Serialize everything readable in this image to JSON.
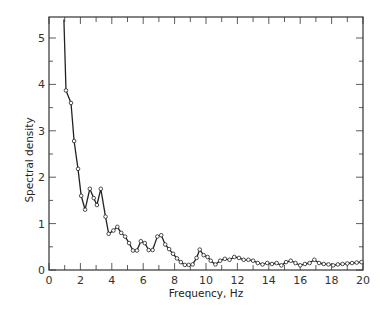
{
  "chart_data": {
    "type": "line",
    "title": "",
    "xlabel": "Frequency, Hz",
    "ylabel": "Spectral density",
    "xlim": [
      0,
      20
    ],
    "ylim": [
      0,
      5.4
    ],
    "xticks": [
      0,
      2,
      4,
      6,
      8,
      10,
      12,
      14,
      16,
      18,
      20
    ],
    "xtick_labels": [
      "0",
      "2",
      "4",
      "6",
      "8",
      "10",
      "12",
      "14",
      "16",
      "18",
      "20"
    ],
    "yticks": [
      0,
      1,
      2,
      3,
      4,
      5
    ],
    "ytick_labels": [
      "0",
      "1",
      "2",
      "3",
      "4",
      "5"
    ],
    "grid": false,
    "legend": null,
    "marker": "open-circle",
    "series": [
      {
        "name": "Spectral density",
        "x": [
          0.95,
          1.08,
          1.4,
          1.6,
          1.85,
          2.05,
          2.3,
          2.6,
          2.85,
          3.05,
          3.3,
          3.6,
          3.8,
          4.1,
          4.35,
          4.6,
          4.85,
          5.1,
          5.35,
          5.6,
          5.85,
          6.1,
          6.35,
          6.6,
          6.9,
          7.15,
          7.4,
          7.65,
          7.9,
          8.15,
          8.4,
          8.65,
          8.9,
          9.15,
          9.4,
          9.6,
          9.85,
          10.1,
          10.3,
          10.6,
          10.9,
          11.2,
          11.5,
          11.8,
          12.1,
          12.4,
          12.7,
          13.0,
          13.3,
          13.6,
          13.9,
          14.2,
          14.5,
          14.8,
          15.1,
          15.4,
          15.7,
          16.0,
          16.3,
          16.6,
          16.9,
          17.2,
          17.5,
          17.8,
          18.1,
          18.4,
          18.7,
          19.0,
          19.3,
          19.6,
          19.9
        ],
        "y": [
          5.4,
          3.87,
          3.6,
          2.78,
          2.18,
          1.6,
          1.3,
          1.75,
          1.55,
          1.4,
          1.75,
          1.15,
          0.78,
          0.85,
          0.93,
          0.8,
          0.72,
          0.58,
          0.42,
          0.42,
          0.62,
          0.58,
          0.43,
          0.43,
          0.72,
          0.75,
          0.55,
          0.45,
          0.35,
          0.25,
          0.17,
          0.11,
          0.11,
          0.12,
          0.26,
          0.44,
          0.32,
          0.28,
          0.2,
          0.12,
          0.2,
          0.24,
          0.22,
          0.28,
          0.26,
          0.22,
          0.22,
          0.2,
          0.15,
          0.12,
          0.15,
          0.13,
          0.15,
          0.1,
          0.17,
          0.2,
          0.15,
          0.1,
          0.13,
          0.15,
          0.22,
          0.15,
          0.13,
          0.12,
          0.1,
          0.12,
          0.13,
          0.14,
          0.15,
          0.16,
          0.17
        ]
      }
    ],
    "colors": {
      "line": "#222222",
      "frame": "#333333",
      "background": "#ffffff"
    }
  }
}
